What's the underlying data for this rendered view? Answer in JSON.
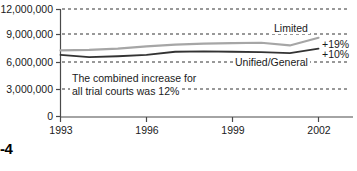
{
  "figure": {
    "number_label": "-4"
  },
  "chart_data": {
    "type": "line",
    "title": "",
    "subtitle": "",
    "xlabel": "",
    "ylabel": "",
    "xlim": [
      1993,
      2003
    ],
    "ylim": [
      0,
      12000000
    ],
    "grid": true,
    "grid_style": "dashed-horizontal",
    "legend_position": "inline-right",
    "x": [
      1993,
      1994,
      1995,
      1996,
      1997,
      1998,
      1999,
      2000,
      2001,
      2002
    ],
    "ytick_labels": [
      "12,000,000",
      "9,000,000",
      "6,000,000",
      "3,000,000",
      "0"
    ],
    "ytick_values": [
      12000000,
      9000000,
      6000000,
      3000000,
      0
    ],
    "xtick_labels": [
      "1993",
      "1996",
      "1999",
      "2002"
    ],
    "xtick_values": [
      1993,
      1996,
      1999,
      2002
    ],
    "series": [
      {
        "name": "Limited",
        "color": "#a6a6a6",
        "change_label": "+19%",
        "values": [
          7400000,
          7450000,
          7600000,
          7850000,
          8050000,
          8150000,
          8200000,
          8250000,
          7950000,
          8800000
        ]
      },
      {
        "name": "Unified/General",
        "color": "#333333",
        "change_label": "+10%",
        "values": [
          6900000,
          6650000,
          6750000,
          6900000,
          7250000,
          7300000,
          7250000,
          7200000,
          7100000,
          7600000
        ]
      }
    ],
    "annotations": [
      {
        "name": "combined-increase-note",
        "line1": "The combined increase for",
        "line2": "all trial courts was 12%"
      }
    ]
  }
}
